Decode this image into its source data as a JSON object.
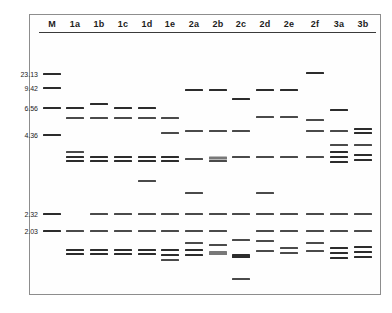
{
  "figure": {
    "type": "agarose-gel-electrophoresis",
    "lane_count": 14,
    "marker_lane": "M",
    "size_unit": "kb",
    "band_color": "#4a4a4a",
    "frame_color": "#8d8d8d",
    "background_color": "#ffffff"
  },
  "lanes": [
    {
      "id": "M",
      "label": "M",
      "x": 52
    },
    {
      "id": "1a",
      "label": "1a",
      "x": 75
    },
    {
      "id": "1b",
      "label": "1b",
      "x": 99
    },
    {
      "id": "1c",
      "label": "1c",
      "x": 123
    },
    {
      "id": "1d",
      "label": "1d",
      "x": 147
    },
    {
      "id": "1e",
      "label": "1e",
      "x": 170
    },
    {
      "id": "2a",
      "label": "2a",
      "x": 194
    },
    {
      "id": "2b",
      "label": "2b",
      "x": 218
    },
    {
      "id": "2c",
      "label": "2c",
      "x": 241
    },
    {
      "id": "2d",
      "label": "2d",
      "x": 265
    },
    {
      "id": "2e",
      "label": "2e",
      "x": 289
    },
    {
      "id": "2f",
      "label": "2f",
      "x": 315
    },
    {
      "id": "3a",
      "label": "3a",
      "x": 339
    },
    {
      "id": "3b",
      "label": "3b",
      "x": 363
    }
  ],
  "markers": [
    {
      "label": "23.13",
      "y": 74,
      "band_y": 74
    },
    {
      "label": "9.42",
      "y": 88,
      "band_y": 88
    },
    {
      "label": "6.56",
      "y": 108,
      "band_y": 108
    },
    {
      "label": "4.36",
      "y": 135,
      "band_y": 135
    },
    {
      "label": "2.32",
      "y": 214,
      "band_y": 214
    },
    {
      "label": "2.03",
      "y": 231,
      "band_y": 231
    }
  ],
  "bands": [
    {
      "lane": "M",
      "y": 74,
      "w": 18,
      "h": 2,
      "weight": "strong"
    },
    {
      "lane": "M",
      "y": 88,
      "w": 18,
      "h": 2,
      "weight": "strong"
    },
    {
      "lane": "M",
      "y": 108,
      "w": 18,
      "h": 2,
      "weight": "strong"
    },
    {
      "lane": "M",
      "y": 135,
      "w": 18,
      "h": 2,
      "weight": "strong"
    },
    {
      "lane": "M",
      "y": 214,
      "w": 18,
      "h": 2,
      "weight": "strong"
    },
    {
      "lane": "M",
      "y": 231,
      "w": 18,
      "h": 2,
      "weight": "strong"
    },
    {
      "lane": "1a",
      "y": 108,
      "w": 18,
      "h": 2,
      "weight": "strong"
    },
    {
      "lane": "1a",
      "y": 118,
      "w": 18,
      "h": 2,
      "weight": "normal"
    },
    {
      "lane": "1a",
      "y": 152,
      "w": 18,
      "h": 2,
      "weight": "normal"
    },
    {
      "lane": "1a",
      "y": 157,
      "w": 18,
      "h": 2,
      "weight": "strong"
    },
    {
      "lane": "1a",
      "y": 161,
      "w": 18,
      "h": 2,
      "weight": "strong"
    },
    {
      "lane": "1a",
      "y": 231,
      "w": 18,
      "h": 2,
      "weight": "normal"
    },
    {
      "lane": "1a",
      "y": 250,
      "w": 18,
      "h": 2,
      "weight": "strong"
    },
    {
      "lane": "1a",
      "y": 254,
      "w": 18,
      "h": 2,
      "weight": "strong"
    },
    {
      "lane": "1b",
      "y": 104,
      "w": 18,
      "h": 2,
      "weight": "strong"
    },
    {
      "lane": "1b",
      "y": 118,
      "w": 18,
      "h": 2,
      "weight": "normal"
    },
    {
      "lane": "1b",
      "y": 157,
      "w": 18,
      "h": 2,
      "weight": "strong"
    },
    {
      "lane": "1b",
      "y": 161,
      "w": 18,
      "h": 2,
      "weight": "strong"
    },
    {
      "lane": "1b",
      "y": 214,
      "w": 18,
      "h": 2,
      "weight": "normal"
    },
    {
      "lane": "1b",
      "y": 231,
      "w": 18,
      "h": 2,
      "weight": "normal"
    },
    {
      "lane": "1b",
      "y": 250,
      "w": 18,
      "h": 2,
      "weight": "strong"
    },
    {
      "lane": "1b",
      "y": 254,
      "w": 18,
      "h": 2,
      "weight": "strong"
    },
    {
      "lane": "1c",
      "y": 108,
      "w": 18,
      "h": 2,
      "weight": "strong"
    },
    {
      "lane": "1c",
      "y": 118,
      "w": 18,
      "h": 2,
      "weight": "normal"
    },
    {
      "lane": "1c",
      "y": 157,
      "w": 18,
      "h": 2,
      "weight": "strong"
    },
    {
      "lane": "1c",
      "y": 161,
      "w": 18,
      "h": 2,
      "weight": "strong"
    },
    {
      "lane": "1c",
      "y": 214,
      "w": 18,
      "h": 2,
      "weight": "normal"
    },
    {
      "lane": "1c",
      "y": 231,
      "w": 18,
      "h": 2,
      "weight": "normal"
    },
    {
      "lane": "1c",
      "y": 250,
      "w": 18,
      "h": 2,
      "weight": "strong"
    },
    {
      "lane": "1c",
      "y": 254,
      "w": 18,
      "h": 2,
      "weight": "strong"
    },
    {
      "lane": "1d",
      "y": 108,
      "w": 18,
      "h": 2,
      "weight": "strong"
    },
    {
      "lane": "1d",
      "y": 118,
      "w": 18,
      "h": 2,
      "weight": "normal"
    },
    {
      "lane": "1d",
      "y": 157,
      "w": 18,
      "h": 2,
      "weight": "strong"
    },
    {
      "lane": "1d",
      "y": 161,
      "w": 18,
      "h": 2,
      "weight": "strong"
    },
    {
      "lane": "1d",
      "y": 181,
      "w": 18,
      "h": 2,
      "weight": "normal"
    },
    {
      "lane": "1d",
      "y": 214,
      "w": 18,
      "h": 2,
      "weight": "normal"
    },
    {
      "lane": "1d",
      "y": 231,
      "w": 18,
      "h": 2,
      "weight": "normal"
    },
    {
      "lane": "1d",
      "y": 250,
      "w": 18,
      "h": 2,
      "weight": "strong"
    },
    {
      "lane": "1d",
      "y": 254,
      "w": 18,
      "h": 2,
      "weight": "strong"
    },
    {
      "lane": "1e",
      "y": 118,
      "w": 18,
      "h": 2,
      "weight": "normal"
    },
    {
      "lane": "1e",
      "y": 133,
      "w": 18,
      "h": 2,
      "weight": "normal"
    },
    {
      "lane": "1e",
      "y": 157,
      "w": 18,
      "h": 2,
      "weight": "strong"
    },
    {
      "lane": "1e",
      "y": 161,
      "w": 18,
      "h": 2,
      "weight": "strong"
    },
    {
      "lane": "1e",
      "y": 214,
      "w": 18,
      "h": 2,
      "weight": "normal"
    },
    {
      "lane": "1e",
      "y": 231,
      "w": 18,
      "h": 2,
      "weight": "normal"
    },
    {
      "lane": "1e",
      "y": 250,
      "w": 18,
      "h": 2,
      "weight": "strong"
    },
    {
      "lane": "1e",
      "y": 255,
      "w": 18,
      "h": 2,
      "weight": "strong"
    },
    {
      "lane": "1e",
      "y": 260,
      "w": 18,
      "h": 2,
      "weight": "normal"
    },
    {
      "lane": "2a",
      "y": 90,
      "w": 18,
      "h": 2,
      "weight": "strong"
    },
    {
      "lane": "2a",
      "y": 131,
      "w": 18,
      "h": 2,
      "weight": "normal"
    },
    {
      "lane": "2a",
      "y": 159,
      "w": 18,
      "h": 2,
      "weight": "normal"
    },
    {
      "lane": "2a",
      "y": 193,
      "w": 18,
      "h": 2,
      "weight": "normal"
    },
    {
      "lane": "2a",
      "y": 214,
      "w": 18,
      "h": 2,
      "weight": "normal"
    },
    {
      "lane": "2a",
      "y": 231,
      "w": 18,
      "h": 2,
      "weight": "normal"
    },
    {
      "lane": "2a",
      "y": 243,
      "w": 18,
      "h": 2,
      "weight": "normal"
    },
    {
      "lane": "2a",
      "y": 250,
      "w": 18,
      "h": 2,
      "weight": "strong"
    },
    {
      "lane": "2a",
      "y": 255,
      "w": 18,
      "h": 2,
      "weight": "strong"
    },
    {
      "lane": "2b",
      "y": 90,
      "w": 18,
      "h": 2,
      "weight": "strong"
    },
    {
      "lane": "2b",
      "y": 131,
      "w": 18,
      "h": 2,
      "weight": "normal"
    },
    {
      "lane": "2b",
      "y": 158,
      "w": 18,
      "h": 3,
      "weight": "faint"
    },
    {
      "lane": "2b",
      "y": 161,
      "w": 18,
      "h": 2,
      "weight": "normal"
    },
    {
      "lane": "2b",
      "y": 214,
      "w": 18,
      "h": 2,
      "weight": "normal"
    },
    {
      "lane": "2b",
      "y": 231,
      "w": 18,
      "h": 2,
      "weight": "normal"
    },
    {
      "lane": "2b",
      "y": 245,
      "w": 18,
      "h": 2,
      "weight": "normal"
    },
    {
      "lane": "2b",
      "y": 253,
      "w": 18,
      "h": 4,
      "weight": "faint"
    },
    {
      "lane": "2c",
      "y": 99,
      "w": 18,
      "h": 2,
      "weight": "strong"
    },
    {
      "lane": "2c",
      "y": 131,
      "w": 18,
      "h": 2,
      "weight": "normal"
    },
    {
      "lane": "2c",
      "y": 157,
      "w": 18,
      "h": 2,
      "weight": "normal"
    },
    {
      "lane": "2c",
      "y": 214,
      "w": 18,
      "h": 2,
      "weight": "normal"
    },
    {
      "lane": "2c",
      "y": 240,
      "w": 18,
      "h": 2,
      "weight": "normal"
    },
    {
      "lane": "2c",
      "y": 256,
      "w": 18,
      "h": 4,
      "weight": "strong"
    },
    {
      "lane": "2c",
      "y": 279,
      "w": 18,
      "h": 2,
      "weight": "normal"
    },
    {
      "lane": "2d",
      "y": 90,
      "w": 18,
      "h": 2,
      "weight": "strong"
    },
    {
      "lane": "2d",
      "y": 117,
      "w": 18,
      "h": 2,
      "weight": "normal"
    },
    {
      "lane": "2d",
      "y": 157,
      "w": 18,
      "h": 2,
      "weight": "normal"
    },
    {
      "lane": "2d",
      "y": 193,
      "w": 18,
      "h": 2,
      "weight": "normal"
    },
    {
      "lane": "2d",
      "y": 214,
      "w": 18,
      "h": 2,
      "weight": "normal"
    },
    {
      "lane": "2d",
      "y": 231,
      "w": 18,
      "h": 2,
      "weight": "normal"
    },
    {
      "lane": "2d",
      "y": 241,
      "w": 18,
      "h": 2,
      "weight": "normal"
    },
    {
      "lane": "2d",
      "y": 251,
      "w": 18,
      "h": 2,
      "weight": "normal"
    },
    {
      "lane": "2e",
      "y": 90,
      "w": 18,
      "h": 2,
      "weight": "strong"
    },
    {
      "lane": "2e",
      "y": 117,
      "w": 18,
      "h": 2,
      "weight": "normal"
    },
    {
      "lane": "2e",
      "y": 157,
      "w": 18,
      "h": 2,
      "weight": "normal"
    },
    {
      "lane": "2e",
      "y": 214,
      "w": 18,
      "h": 2,
      "weight": "normal"
    },
    {
      "lane": "2e",
      "y": 231,
      "w": 18,
      "h": 2,
      "weight": "normal"
    },
    {
      "lane": "2e",
      "y": 248,
      "w": 18,
      "h": 2,
      "weight": "normal"
    },
    {
      "lane": "2e",
      "y": 253,
      "w": 18,
      "h": 2,
      "weight": "normal"
    },
    {
      "lane": "2f",
      "y": 73,
      "w": 18,
      "h": 2,
      "weight": "strong"
    },
    {
      "lane": "2f",
      "y": 120,
      "w": 18,
      "h": 2,
      "weight": "normal"
    },
    {
      "lane": "2f",
      "y": 131,
      "w": 18,
      "h": 2,
      "weight": "normal"
    },
    {
      "lane": "2f",
      "y": 157,
      "w": 18,
      "h": 2,
      "weight": "normal"
    },
    {
      "lane": "2f",
      "y": 214,
      "w": 18,
      "h": 2,
      "weight": "normal"
    },
    {
      "lane": "2f",
      "y": 231,
      "w": 18,
      "h": 2,
      "weight": "normal"
    },
    {
      "lane": "2f",
      "y": 243,
      "w": 18,
      "h": 2,
      "weight": "normal"
    },
    {
      "lane": "2f",
      "y": 251,
      "w": 18,
      "h": 2,
      "weight": "normal"
    },
    {
      "lane": "3a",
      "y": 110,
      "w": 18,
      "h": 2,
      "weight": "strong"
    },
    {
      "lane": "3a",
      "y": 131,
      "w": 18,
      "h": 2,
      "weight": "normal"
    },
    {
      "lane": "3a",
      "y": 145,
      "w": 18,
      "h": 2,
      "weight": "normal"
    },
    {
      "lane": "3a",
      "y": 152,
      "w": 18,
      "h": 2,
      "weight": "strong"
    },
    {
      "lane": "3a",
      "y": 157,
      "w": 18,
      "h": 2,
      "weight": "strong"
    },
    {
      "lane": "3a",
      "y": 162,
      "w": 18,
      "h": 2,
      "weight": "strong"
    },
    {
      "lane": "3a",
      "y": 214,
      "w": 18,
      "h": 2,
      "weight": "normal"
    },
    {
      "lane": "3a",
      "y": 231,
      "w": 18,
      "h": 2,
      "weight": "normal"
    },
    {
      "lane": "3a",
      "y": 248,
      "w": 18,
      "h": 2,
      "weight": "strong"
    },
    {
      "lane": "3a",
      "y": 253,
      "w": 18,
      "h": 2,
      "weight": "strong"
    },
    {
      "lane": "3a",
      "y": 258,
      "w": 18,
      "h": 2,
      "weight": "strong"
    },
    {
      "lane": "3b",
      "y": 129,
      "w": 18,
      "h": 2,
      "weight": "strong"
    },
    {
      "lane": "3b",
      "y": 133,
      "w": 18,
      "h": 2,
      "weight": "strong"
    },
    {
      "lane": "3b",
      "y": 145,
      "w": 18,
      "h": 2,
      "weight": "normal"
    },
    {
      "lane": "3b",
      "y": 155,
      "w": 18,
      "h": 2,
      "weight": "strong"
    },
    {
      "lane": "3b",
      "y": 160,
      "w": 18,
      "h": 2,
      "weight": "strong"
    },
    {
      "lane": "3b",
      "y": 214,
      "w": 18,
      "h": 2,
      "weight": "normal"
    },
    {
      "lane": "3b",
      "y": 231,
      "w": 18,
      "h": 2,
      "weight": "normal"
    },
    {
      "lane": "3b",
      "y": 247,
      "w": 18,
      "h": 2,
      "weight": "strong"
    },
    {
      "lane": "3b",
      "y": 252,
      "w": 18,
      "h": 2,
      "weight": "strong"
    },
    {
      "lane": "3b",
      "y": 257,
      "w": 18,
      "h": 2,
      "weight": "strong"
    }
  ]
}
